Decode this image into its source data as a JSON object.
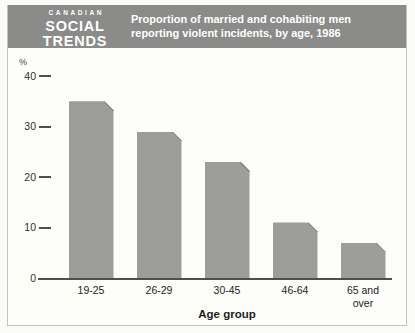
{
  "header": {
    "logo": {
      "line1": "CANADIAN",
      "line2": "SOCIAL",
      "line3": "TRENDS"
    },
    "title": "Proportion of married and cohabiting men reporting violent incidents, by age, 1986",
    "bg_color": "#8b8b8a"
  },
  "chart_data": {
    "type": "bar",
    "title": "Proportion of married and cohabiting men reporting violent incidents, by age, 1986",
    "categories": [
      "19-25",
      "26-29",
      "30-45",
      "46-64",
      "65 and over"
    ],
    "values": [
      35,
      29,
      23,
      11,
      7
    ],
    "unit_label": "%",
    "xlabel": "Age group",
    "ylabel": "%",
    "ylim": [
      0,
      40
    ],
    "yticks": [
      40,
      30,
      20,
      10,
      0
    ],
    "grid": false,
    "legend": "none",
    "bar_color": "#9d9d9c",
    "axis_color": "#4f4f4f"
  }
}
